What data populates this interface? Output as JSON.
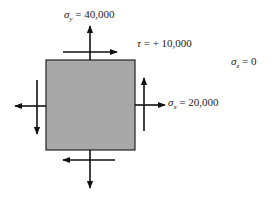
{
  "diagram": {
    "type": "plane stress element",
    "element_fill": "#a8a8a8",
    "arrow_color": "#111111",
    "labels": {
      "sigma_y": {
        "symbol": "σ",
        "subscript": "y",
        "value": "= 40,000"
      },
      "tau": {
        "symbol": "τ",
        "value": "= + 10,000"
      },
      "sigma_z": {
        "symbol": "σ",
        "subscript": "z",
        "value": "= 0"
      },
      "sigma_x": {
        "symbol": "σ",
        "subscript": "x",
        "value": "= 20,000"
      }
    },
    "arrows": [
      {
        "name": "normal-top",
        "direction": "up"
      },
      {
        "name": "shear-top",
        "direction": "right"
      },
      {
        "name": "normal-right",
        "direction": "right"
      },
      {
        "name": "shear-right",
        "direction": "up"
      },
      {
        "name": "normal-left",
        "direction": "left"
      },
      {
        "name": "shear-left",
        "direction": "down"
      },
      {
        "name": "normal-bottom",
        "direction": "down"
      },
      {
        "name": "shear-bottom",
        "direction": "left"
      }
    ]
  }
}
